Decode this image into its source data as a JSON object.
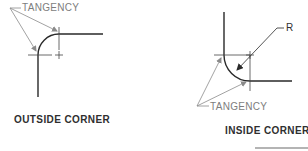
{
  "diagram": {
    "outside": {
      "tangency_label": "TANGENCY",
      "caption": "OUTSIDE CORNER"
    },
    "inside": {
      "radius_label": "R",
      "tangency_label": "TANGENCY",
      "caption": "INSIDE CORNER"
    },
    "colors": {
      "line": "#2a2a2a",
      "leader": "#8a8a8a",
      "text_light": "#7d7d7d",
      "text_bold": "#2f2f2f"
    }
  }
}
